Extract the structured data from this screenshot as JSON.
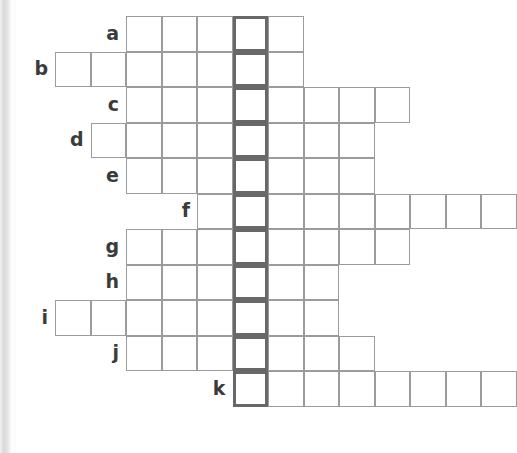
{
  "puzzle": {
    "kind": "crossword-skeleton",
    "title": "",
    "highlight_color": "#686868",
    "cell_border_color": "#9b9b9b",
    "label_color": "#3b3b3b",
    "background_color": "#ffffff",
    "cell_size": 35.5,
    "origin_x": 55,
    "origin_y": 16,
    "highlight_column": 5,
    "row_labels": [
      "a",
      "b",
      "c",
      "d",
      "e",
      "f",
      "g",
      "h",
      "i",
      "j",
      "k"
    ],
    "rows": [
      {
        "label": "a",
        "start_col": 2,
        "cells": 5,
        "highlight_index": 3,
        "letters": [
          "",
          "",
          "",
          "",
          ""
        ]
      },
      {
        "label": "b",
        "start_col": 0,
        "cells": 7,
        "highlight_index": 5,
        "letters": [
          "",
          "",
          "",
          "",
          "",
          "",
          ""
        ]
      },
      {
        "label": "c",
        "start_col": 2,
        "cells": 8,
        "highlight_index": 3,
        "letters": [
          "",
          "",
          "",
          "",
          "",
          "",
          "",
          ""
        ]
      },
      {
        "label": "d",
        "start_col": 1,
        "cells": 8,
        "highlight_index": 4,
        "letters": [
          "",
          "",
          "",
          "",
          "",
          "",
          "",
          ""
        ]
      },
      {
        "label": "e",
        "start_col": 2,
        "cells": 7,
        "highlight_index": 3,
        "letters": [
          "",
          "",
          "",
          "",
          "",
          "",
          ""
        ]
      },
      {
        "label": "f",
        "start_col": 4,
        "cells": 9,
        "highlight_index": 1,
        "letters": [
          "",
          "",
          "",
          "",
          "",
          "",
          "",
          "",
          ""
        ]
      },
      {
        "label": "g",
        "start_col": 2,
        "cells": 8,
        "highlight_index": 3,
        "letters": [
          "",
          "",
          "",
          "",
          "",
          "",
          "",
          ""
        ]
      },
      {
        "label": "h",
        "start_col": 2,
        "cells": 6,
        "highlight_index": 3,
        "letters": [
          "",
          "",
          "",
          "",
          "",
          ""
        ]
      },
      {
        "label": "i",
        "start_col": 0,
        "cells": 8,
        "highlight_index": 5,
        "letters": [
          "",
          "",
          "",
          "",
          "",
          "",
          "",
          ""
        ]
      },
      {
        "label": "j",
        "start_col": 2,
        "cells": 7,
        "highlight_index": 3,
        "letters": [
          "",
          "",
          "",
          "",
          "",
          "",
          ""
        ]
      },
      {
        "label": "k",
        "start_col": 5,
        "cells": 8,
        "highlight_index": 0,
        "letters": [
          "",
          "",
          "",
          "",
          "",
          "",
          "",
          ""
        ]
      }
    ]
  }
}
